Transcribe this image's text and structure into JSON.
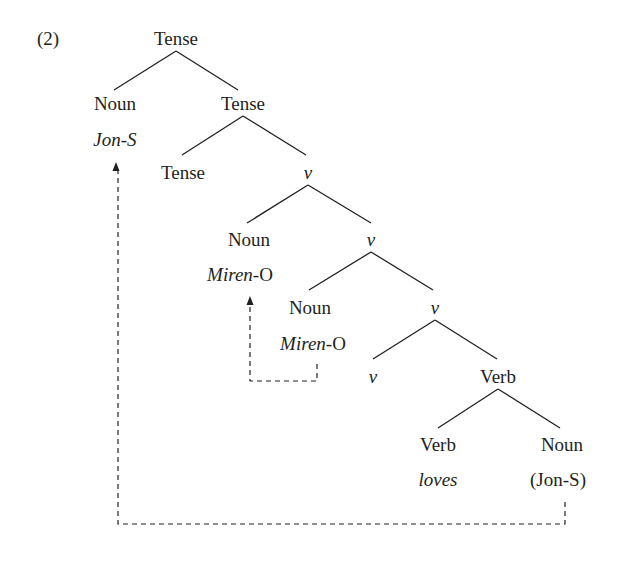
{
  "example_number": "(2)",
  "colors": {
    "ink": "#231f20",
    "background": "#ffffff"
  },
  "nodes": {
    "root_tense": "Tense",
    "subject_noun": "Noun",
    "subject_word": "Jon-S",
    "tense_bar": "Tense",
    "tense_head": "Tense",
    "v1": "v",
    "object_noun": "Noun",
    "object_word": "Miren-O",
    "v2": "v",
    "object_noun_low": "Noun",
    "object_word_low": "Miren-O",
    "v3": "v",
    "v_head": "v",
    "verb_phrase": "Verb",
    "verb_head": "Verb",
    "verb_word": "loves",
    "verb_complement_noun": "Noun",
    "verb_complement_trace": "(Jon-S)"
  },
  "edges": [
    [
      "Tense",
      "Noun"
    ],
    [
      "Tense",
      "Tense"
    ],
    [
      "Tense",
      "Tense"
    ],
    [
      "Tense",
      "v"
    ],
    [
      "v",
      "Noun"
    ],
    [
      "v",
      "v"
    ],
    [
      "v",
      "Noun"
    ],
    [
      "v",
      "v"
    ],
    [
      "v",
      "v"
    ],
    [
      "v",
      "Verb"
    ],
    [
      "Verb",
      "Verb"
    ],
    [
      "Verb",
      "Noun"
    ]
  ],
  "movement_arrows": [
    {
      "from": "Noun (Jon-S)",
      "to": "Noun Jon-S",
      "style": "dashed"
    },
    {
      "from": "Noun Miren-O (lower)",
      "to": "Noun Miren-O (upper)",
      "style": "dashed"
    }
  ]
}
